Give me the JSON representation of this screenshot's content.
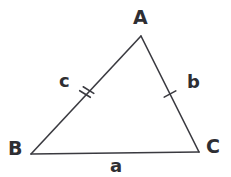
{
  "figure": {
    "kind": "geometry-diagram",
    "shape": "triangle",
    "background_color": "#ffffff",
    "stroke_color": "#3a3a40",
    "label_color": "#2e2e33",
    "width": 231,
    "height": 177
  },
  "vertices": [
    {
      "id": "A",
      "label": "A",
      "x": 141,
      "y": 36,
      "label_x": 133,
      "label_y": 8,
      "label_position": "above"
    },
    {
      "id": "B",
      "label": "B",
      "x": 31,
      "y": 154,
      "label_x": 8,
      "label_y": 139,
      "label_position": "left"
    },
    {
      "id": "C",
      "label": "C",
      "x": 199,
      "y": 152,
      "label_x": 206,
      "label_y": 137,
      "label_position": "right"
    }
  ],
  "sides": [
    {
      "id": "a",
      "label": "a",
      "from": "B",
      "to": "C",
      "x1": 31,
      "y1": 154,
      "x2": 199,
      "y2": 152,
      "tick_count": 0,
      "label_x": 110,
      "label_y": 157,
      "label_position": "below"
    },
    {
      "id": "b",
      "label": "b",
      "from": "A",
      "to": "C",
      "x1": 141,
      "y1": 36,
      "x2": 199,
      "y2": 152,
      "tick_count": 1,
      "tick_center_x": 170,
      "tick_center_y": 94,
      "label_x": 187,
      "label_y": 73,
      "label_position": "right"
    },
    {
      "id": "c",
      "label": "c",
      "from": "A",
      "to": "B",
      "x1": 141,
      "y1": 36,
      "x2": 31,
      "y2": 154,
      "tick_count": 2,
      "tick_center_x": 86,
      "tick_center_y": 95,
      "label_x": 59,
      "label_y": 72,
      "label_position": "upper-left"
    }
  ],
  "strokes": {
    "side_width": 1.6,
    "tick_width": 1.6,
    "tick_length": 13,
    "tick_gap": 5
  }
}
